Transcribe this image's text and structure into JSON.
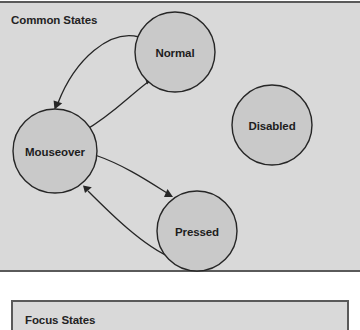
{
  "page": {
    "background_color": "#ffffff",
    "width": 360,
    "height": 330
  },
  "panels": [
    {
      "id": "common-states",
      "title": "Common States",
      "background_color": "#d9d9d9",
      "border_color": "#5a5a5a"
    },
    {
      "id": "focus-states",
      "title": "Focus States",
      "background_color": "#d9d9d9",
      "border_color": "#5a5a5a"
    }
  ],
  "diagram": {
    "type": "state-diagram",
    "node_fill": "#c9c9c9",
    "node_stroke": "#262626",
    "edge_stroke": "#262626",
    "nodes": [
      {
        "id": "normal",
        "label": "Normal",
        "cx": 175,
        "cy": 49,
        "r": 40
      },
      {
        "id": "mouseover",
        "label": "Mouseover",
        "cx": 55,
        "cy": 148,
        "r": 42
      },
      {
        "id": "pressed",
        "label": "Pressed",
        "cx": 197,
        "cy": 228,
        "r": 40
      },
      {
        "id": "disabled",
        "label": "Disabled",
        "cx": 272,
        "cy": 122,
        "r": 40
      }
    ],
    "edges": [
      {
        "id": "normal-to-mouseover",
        "from": "normal",
        "to": "mouseover",
        "label": ""
      },
      {
        "id": "mouseover-to-normal",
        "from": "mouseover",
        "to": "normal",
        "label": ""
      },
      {
        "id": "mouseover-to-pressed",
        "from": "mouseover",
        "to": "pressed",
        "label": ""
      },
      {
        "id": "pressed-to-mouseover",
        "from": "pressed",
        "to": "mouseover",
        "label": ""
      }
    ]
  }
}
